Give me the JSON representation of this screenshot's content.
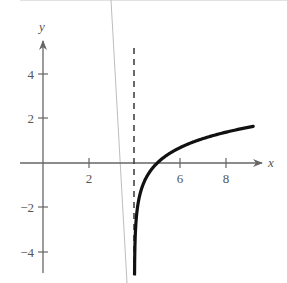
{
  "chart_data": {
    "type": "line",
    "title": "",
    "xlabel": "x",
    "ylabel": "y",
    "xlim": [
      0,
      9.6
    ],
    "ylim": [
      -5,
      5.5
    ],
    "grid": false,
    "x_ticks": [
      2,
      4,
      6,
      8
    ],
    "x_tick_labels": [
      "2",
      "",
      "6",
      "8"
    ],
    "y_ticks": [
      4,
      2,
      -2,
      -4
    ],
    "y_tick_labels": [
      "4",
      "2",
      "-2",
      "-4"
    ],
    "asymptote": {
      "type": "vertical",
      "x": 4,
      "style": "dashed"
    },
    "series": [
      {
        "name": "y = ln(x - 4)",
        "x": [
          4.005,
          4.02,
          4.05,
          4.1,
          4.2,
          4.4,
          4.7,
          5.0,
          5.5,
          6.0,
          6.5,
          7.0,
          7.5,
          8.0,
          8.5,
          9.0,
          9.2
        ],
        "y": [
          -5.3,
          -3.9,
          -3.0,
          -2.3,
          -1.61,
          -0.92,
          -0.36,
          0.0,
          0.41,
          0.69,
          0.92,
          1.1,
          1.25,
          1.39,
          1.5,
          1.61,
          1.65
        ]
      }
    ],
    "colors": {
      "curve": "#111111",
      "axes": "#666666",
      "asymptote": "#444444",
      "artifact_line": "#bbbbbb"
    }
  },
  "labels": {
    "x_axis": "x",
    "y_axis": "y",
    "xt2": "2",
    "xt6": "6",
    "xt8": "8",
    "yt4": "4",
    "yt2": "2",
    "ytm2": "−2",
    "ytm4": "−4"
  }
}
